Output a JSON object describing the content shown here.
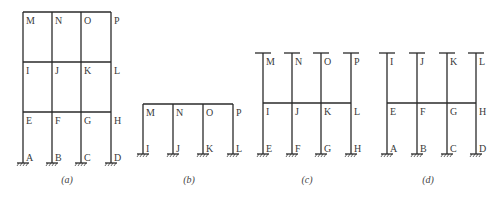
{
  "figures": [
    {
      "id": "a",
      "caption": "(a)",
      "description": "Three-storey, three-bay frame fixed at base",
      "rows": [
        [
          "M",
          "N",
          "O",
          "P"
        ],
        [
          "I",
          "J",
          "K",
          "L"
        ],
        [
          "E",
          "F",
          "G",
          "H"
        ],
        [
          "A",
          "B",
          "C",
          "D"
        ]
      ]
    },
    {
      "id": "b",
      "caption": "(b)",
      "description": "Top storey isolated with fixed supports at I, J, K, L",
      "rows": [
        [
          "M",
          "N",
          "O",
          "P"
        ],
        [
          "I",
          "J",
          "K",
          "L"
        ]
      ]
    },
    {
      "id": "c",
      "caption": "(c)",
      "description": "Middle storey with columns fixed at far ends",
      "rows": [
        [
          "M",
          "N",
          "O",
          "P"
        ],
        [
          "I",
          "J",
          "K",
          "L"
        ],
        [
          "E",
          "F",
          "G",
          "H"
        ]
      ]
    },
    {
      "id": "d",
      "caption": "(d)",
      "description": "Bottom storey with columns fixed at far ends",
      "rows": [
        [
          "I",
          "J",
          "K",
          "L"
        ],
        [
          "E",
          "F",
          "G",
          "H"
        ],
        [
          "A",
          "B",
          "C",
          "D"
        ]
      ]
    }
  ]
}
